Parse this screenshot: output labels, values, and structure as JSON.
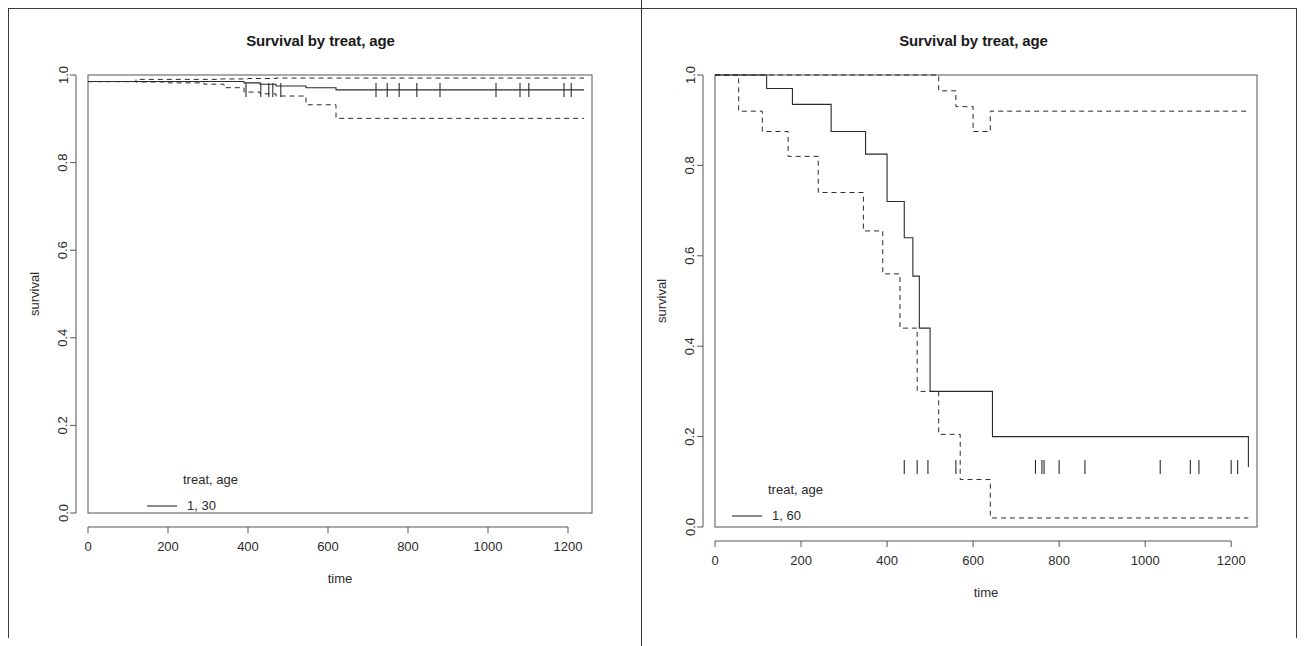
{
  "document": {
    "background_color": "#ffffff",
    "foreground_color": "#1a1a1a",
    "panel_divider": true
  },
  "panels": [
    {
      "id": "left",
      "title": "Survival by treat, age",
      "legend_header": "treat, age",
      "legend_entry": "1, 30"
    },
    {
      "id": "right",
      "title": "Survival by treat, age",
      "legend_header": "treat, age",
      "legend_entry": "1, 60"
    }
  ],
  "chart_data": [
    {
      "type": "line",
      "title": "Survival by treat, age",
      "xlabel": "time",
      "ylabel": "survival",
      "xlim": [
        0,
        1260
      ],
      "ylim": [
        0.0,
        1.0
      ],
      "xticks": [
        0,
        200,
        400,
        600,
        800,
        1000,
        1200
      ],
      "yticks": [
        0.0,
        0.2,
        0.4,
        0.6,
        0.8,
        1.0
      ],
      "xtick_labels": [
        "0",
        "200",
        "400",
        "600",
        "800",
        "1000",
        "1200"
      ],
      "ytick_labels": [
        "0.0",
        "0.2",
        "0.4",
        "0.6",
        "0.8",
        "1.0"
      ],
      "grid": false,
      "legend_position": "bottom-left",
      "legend_title": "treat, age",
      "series": [
        {
          "name": "1, 30",
          "style": "solid",
          "step": "hv",
          "x": [
            0,
            330,
            390,
            430,
            470,
            545,
            620,
            1240
          ],
          "y": [
            0.985,
            0.985,
            0.982,
            0.979,
            0.975,
            0.971,
            0.966,
            0.966
          ]
        },
        {
          "name": "upper CI",
          "style": "dashed",
          "step": "hv",
          "x": [
            0,
            120,
            330,
            400,
            470,
            1240
          ],
          "y": [
            0.985,
            0.99,
            0.991,
            0.992,
            0.993,
            0.993
          ]
        },
        {
          "name": "lower CI",
          "style": "dashed",
          "step": "hv",
          "x": [
            0,
            120,
            200,
            290,
            340,
            390,
            430,
            470,
            545,
            620,
            1240
          ],
          "y": [
            0.985,
            0.984,
            0.982,
            0.979,
            0.971,
            0.961,
            0.957,
            0.952,
            0.932,
            0.901,
            0.901
          ]
        }
      ],
      "censor_marks_x": [
        395,
        432,
        452,
        462,
        482,
        720,
        748,
        778,
        822,
        880,
        1020,
        1080,
        1102,
        1190,
        1208
      ],
      "censor_marks_y": 0.966
    },
    {
      "type": "line",
      "title": "Survival by treat, age",
      "xlabel": "time",
      "ylabel": "survival",
      "xlim": [
        0,
        1260
      ],
      "ylim": [
        0.0,
        1.0
      ],
      "xticks": [
        0,
        200,
        400,
        600,
        800,
        1000,
        1200
      ],
      "yticks": [
        0.0,
        0.2,
        0.4,
        0.6,
        0.8,
        1.0
      ],
      "xtick_labels": [
        "0",
        "200",
        "400",
        "600",
        "800",
        "1000",
        "1200"
      ],
      "ytick_labels": [
        "0.0",
        "0.2",
        "0.4",
        "0.6",
        "0.8",
        "1.0"
      ],
      "grid": false,
      "legend_position": "bottom-left",
      "legend_title": "treat, age",
      "series": [
        {
          "name": "1, 60",
          "style": "solid",
          "step": "hv",
          "x": [
            0,
            60,
            120,
            180,
            270,
            350,
            400,
            440,
            460,
            475,
            500,
            560,
            645,
            1240
          ],
          "y": [
            1.0,
            1.0,
            0.97,
            0.935,
            0.875,
            0.825,
            0.72,
            0.64,
            0.555,
            0.44,
            0.3,
            0.3,
            0.2,
            0.133
          ]
        },
        {
          "name": "upper CI",
          "style": "dashed",
          "step": "hv",
          "x": [
            0,
            480,
            520,
            560,
            600,
            640,
            1240
          ],
          "y": [
            1.0,
            1.0,
            0.965,
            0.93,
            0.875,
            0.92,
            0.92
          ]
        },
        {
          "name": "lower CI",
          "style": "dashed",
          "step": "hv",
          "x": [
            0,
            55,
            110,
            170,
            240,
            300,
            345,
            390,
            430,
            470,
            520,
            570,
            640,
            1240
          ],
          "y": [
            1.0,
            0.92,
            0.875,
            0.82,
            0.74,
            0.74,
            0.655,
            0.56,
            0.44,
            0.3,
            0.205,
            0.105,
            0.02,
            0.02
          ]
        }
      ],
      "censor_marks_x": [
        440,
        470,
        495,
        560,
        745,
        760,
        765,
        800,
        860,
        1035,
        1105,
        1125,
        1200,
        1215
      ],
      "censor_marks_y": 0.133
    }
  ]
}
